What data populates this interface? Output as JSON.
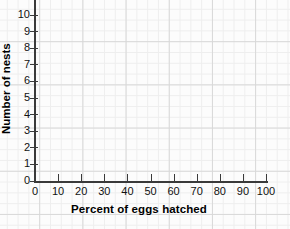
{
  "chart_data": {
    "type": "scatter",
    "title": "",
    "xlabel": "Percent of eggs hatched",
    "ylabel": "Number of nests",
    "xlim": [
      0,
      100
    ],
    "ylim": [
      0,
      10
    ],
    "x_ticks": [
      0,
      10,
      20,
      30,
      40,
      50,
      60,
      70,
      80,
      90,
      100
    ],
    "y_ticks": [
      0,
      1,
      2,
      3,
      4,
      5,
      6,
      7,
      8,
      9,
      10
    ],
    "x_tick_labels": [
      "0",
      "10",
      "20",
      "30",
      "40",
      "50",
      "60",
      "70",
      "80",
      "90",
      "100"
    ],
    "y_tick_labels": [
      "0",
      "1",
      "2",
      "3",
      "4",
      "5",
      "6",
      "7",
      "8",
      "9",
      "10"
    ],
    "series": [
      {
        "name": "",
        "x": [],
        "y": []
      }
    ],
    "grid": true,
    "grid_style": "graph-paper",
    "legend": false,
    "legend_position": "none",
    "annotations": [],
    "note": "Empty coordinate grid — axes and labels drawn, no data points plotted"
  },
  "colors": {
    "axis": "#3a3a3a",
    "grid_major": "#d8d8d8",
    "grid_minor": "#eeeeee",
    "paper": "#fcfcfc",
    "text": "#111111"
  }
}
